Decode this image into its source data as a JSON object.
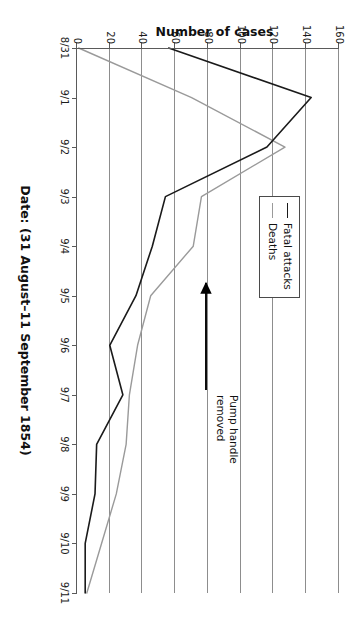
{
  "chart_data": {
    "type": "line",
    "title": "",
    "xlabel": "Date: (31 August–11 September 1854)",
    "ylabel": "Number of cases",
    "categories": [
      "8/31",
      "9/1",
      "9/2",
      "9/3",
      "9/4",
      "9/5",
      "9/6",
      "9/7",
      "9/8",
      "9/9",
      "9/10",
      "9/11"
    ],
    "ylim": [
      0,
      160
    ],
    "ytick_values": [
      0,
      20,
      40,
      60,
      80,
      100,
      120,
      140,
      160
    ],
    "ytick_labels": [
      "0",
      "20",
      "40",
      "60",
      "80",
      "100",
      "120",
      "140",
      "160"
    ],
    "grid": true,
    "legend_position": "upper-right",
    "series": [
      {
        "name": "Fatal attacks",
        "color": "#1a1a1a",
        "values": [
          56,
          143,
          116,
          54,
          46,
          36,
          20,
          28,
          12,
          11,
          5,
          5
        ]
      },
      {
        "name": "Deaths",
        "color": "#9a9a9a",
        "values": [
          1,
          70,
          127,
          76,
          71,
          45,
          37,
          32,
          30,
          24,
          15,
          6
        ]
      }
    ],
    "annotations": [
      {
        "text_line1": "Pump handle",
        "text_line2": "removed",
        "points_to_category": "9/8",
        "arrow": "right-pointing-arrow"
      }
    ]
  },
  "legend": {
    "items": [
      {
        "label": "Fatal attacks"
      },
      {
        "label": "Deaths"
      }
    ]
  },
  "annotation": {
    "line1": "Pump handle",
    "line2": "removed"
  },
  "axes": {
    "x_title": "Date: (31 August–11 September 1854)",
    "y_title": "Number of cases"
  }
}
